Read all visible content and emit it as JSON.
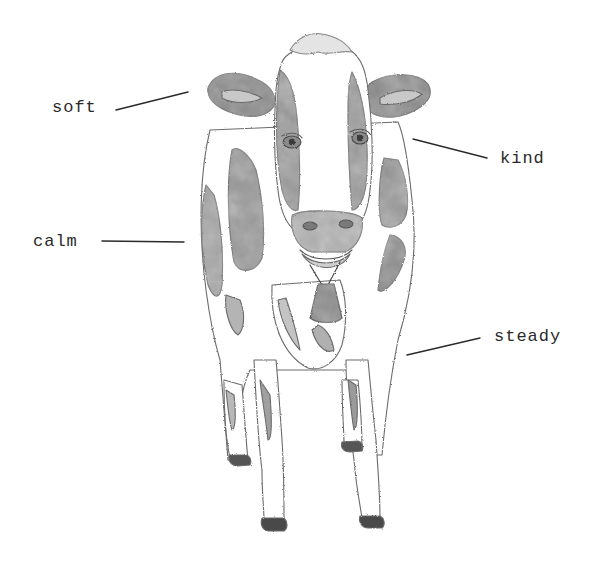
{
  "illustration": {
    "subject": "Holstein cow, front view, wearing a bell",
    "style": "grayscale watercolor sketch"
  },
  "labels": [
    {
      "text": "soft",
      "x": 52,
      "y": 102
    },
    {
      "text": "kind",
      "x": 500,
      "y": 152
    },
    {
      "text": "calm",
      "x": 33,
      "y": 236
    },
    {
      "text": "steady",
      "x": 494,
      "y": 331
    }
  ],
  "leader_lines": [
    {
      "label": "soft",
      "x1": 116,
      "y1": 110,
      "x2": 188,
      "y2": 92
    },
    {
      "label": "kind",
      "x1": 413,
      "y1": 139,
      "x2": 487,
      "y2": 158
    },
    {
      "label": "calm",
      "x1": 102,
      "y1": 241,
      "x2": 184,
      "y2": 242
    },
    {
      "label": "steady",
      "x1": 407,
      "y1": 355,
      "x2": 480,
      "y2": 338
    }
  ],
  "colors": {
    "ink": "#2a2a2a",
    "patch_dark": "#8c8c8c",
    "patch_mid": "#a8a8a8",
    "outline": "#6b6b6b",
    "background": "#ffffff"
  }
}
